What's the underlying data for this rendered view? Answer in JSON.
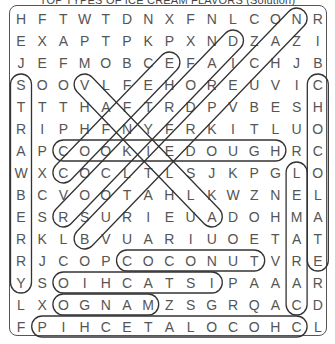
{
  "title": "TOP TYPES OF ICE CREAM FLAVORS (Solution)",
  "grid": {
    "rows": 15,
    "cols": 15,
    "letters": [
      "HFTWTDNXFNLCONR",
      "EXAPTPKPXNDZAZI",
      "JEFMOBCEFAICHJB",
      "SOOVLFEHOREUVIC",
      "TTTHAFTRDPVBESH",
      "RIPHFNYFRKITLUO",
      "APCOOKIEDOUGHRC",
      "WXCOCLTLSJKPGLO",
      "BCVOOTAHLKWZNEL",
      "ESRSURIEUADOHMA",
      "RKLBVUARIUOETAT",
      "RJCOPCOCONUTVRE",
      "YSOIHCATSIPAAAR",
      "LXOGNAMZSGRQACD",
      "FPIHCETALOCOHCL"
    ]
  },
  "solutions": [
    {
      "word": "COOKIEDOUGH",
      "start": [
        6,
        2
      ],
      "end": [
        6,
        12
      ]
    },
    {
      "word": "COCONUT",
      "start": [
        11,
        5
      ],
      "end": [
        11,
        11
      ]
    },
    {
      "word": "PISTACHIO",
      "start": [
        12,
        9
      ],
      "end": [
        12,
        2
      ]
    },
    {
      "word": "MANGO",
      "start": [
        13,
        6
      ],
      "end": [
        13,
        2
      ]
    },
    {
      "word": "CHOCOLATECHIP",
      "start": [
        14,
        13
      ],
      "end": [
        14,
        1
      ]
    },
    {
      "word": "STRAWBERRY",
      "start": [
        3,
        0
      ],
      "end": [
        12,
        0
      ]
    },
    {
      "word": "CHOCOLATE",
      "start": [
        3,
        14
      ],
      "end": [
        11,
        14
      ]
    },
    {
      "word": "CARAMEL",
      "start": [
        13,
        13
      ],
      "end": [
        7,
        13
      ]
    },
    {
      "word": "VANILLA",
      "start": [
        3,
        3
      ],
      "end": [
        9,
        9
      ]
    },
    {
      "word": "COFFEE",
      "start": [
        7,
        2
      ],
      "end": [
        2,
        7
      ]
    },
    {
      "word": "ROCKYROAD",
      "start": [
        9,
        2
      ],
      "end": [
        1,
        10
      ]
    },
    {
      "word": "BUTTERPECAN",
      "start": [
        10,
        3
      ],
      "end": [
        0,
        13
      ]
    }
  ],
  "colors": {
    "ink": "#555555",
    "outline": "#333333",
    "background": "#ffffff"
  }
}
